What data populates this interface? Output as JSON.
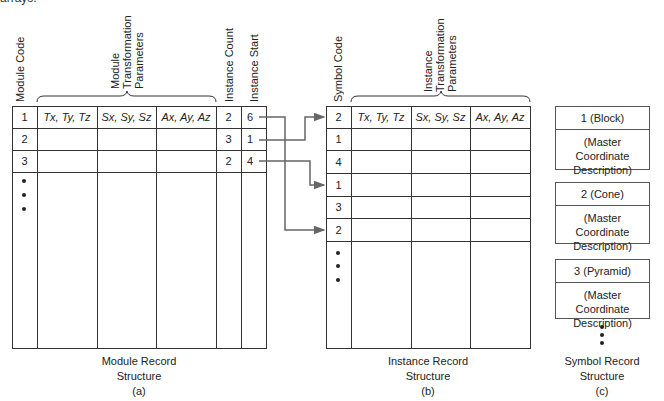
{
  "top_fragment": "arrays.",
  "module_table": {
    "headers": {
      "module_code": "Module Code",
      "transform_group": [
        "Module",
        "Transformation",
        "Parameters"
      ],
      "instance_count": "Instance Count",
      "instance_start": "Instance Start"
    },
    "rows": [
      {
        "code": "1",
        "t": "Tx, Ty, Tz",
        "s": "Sx, Sy, Sz",
        "a": "Ax, Ay, Az",
        "count": "2",
        "start": "6"
      },
      {
        "code": "2",
        "t": "",
        "s": "",
        "a": "",
        "count": "3",
        "start": "1"
      },
      {
        "code": "3",
        "t": "",
        "s": "",
        "a": "",
        "count": "2",
        "start": "4"
      }
    ],
    "caption_line1": "Module Record",
    "caption_line2": "Structure",
    "caption_tag": "(a)"
  },
  "instance_table": {
    "headers": {
      "symbol_code": "Symbol Code",
      "transform_group": [
        "Instance",
        "Transformation",
        "Parameters"
      ]
    },
    "rows": [
      {
        "code": "2",
        "t": "Tx, Ty, Tz",
        "s": "Sx, Sy, Sz",
        "a": "Ax, Ay, Az"
      },
      {
        "code": "1"
      },
      {
        "code": "4"
      },
      {
        "code": "1"
      },
      {
        "code": "3"
      },
      {
        "code": "2"
      }
    ],
    "caption_line1": "Instance Record",
    "caption_line2": "Structure",
    "caption_tag": "(b)"
  },
  "symbol_records": {
    "boxes": [
      {
        "title": "1 (Block)",
        "desc1": "(Master Coordinate",
        "desc2": "Description)"
      },
      {
        "title": "2 (Cone)",
        "desc1": "(Master Coordinate",
        "desc2": "Description)"
      },
      {
        "title": "3 (Pyramid)",
        "desc1": "(Master Coordinate",
        "desc2": "Description)"
      }
    ],
    "caption_line1": "Symbol Record",
    "caption_line2": "Structure",
    "caption_tag": "(c)"
  },
  "arrows": [
    {
      "from_module_row": 1,
      "instance_start": "6",
      "to_instance_row": 6
    },
    {
      "from_module_row": 2,
      "instance_start": "1",
      "to_instance_row": 1
    },
    {
      "from_module_row": 3,
      "instance_start": "4",
      "to_instance_row": 4
    }
  ],
  "colors": {
    "line": "#333333",
    "arrow": "#666666"
  }
}
